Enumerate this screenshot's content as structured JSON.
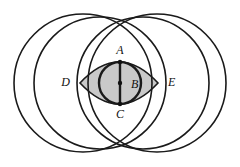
{
  "figure": {
    "canvas": {
      "width": 240,
      "height": 167,
      "background": "#ffffff"
    },
    "style": {
      "stroke_color": "#1a1a1a",
      "shaded_fill": "#c9c9c9",
      "point_color": "#111111",
      "label_color": "#111111",
      "thin_stroke_width": 1.6,
      "thick_stroke_width": 2.4,
      "point_radius": 2.2,
      "label_font_size": 12
    },
    "points": [
      {
        "id": "A",
        "label": "A",
        "x": 120,
        "y": 62,
        "label_x": 120,
        "label_y": 51,
        "anchor": "middle",
        "dot": true
      },
      {
        "id": "B",
        "label": "B",
        "x": 120,
        "y": 83,
        "label_x": 131,
        "label_y": 85,
        "anchor": "start",
        "dot": true
      },
      {
        "id": "C",
        "label": "C",
        "x": 120,
        "y": 104,
        "label_x": 120,
        "label_y": 115,
        "anchor": "middle",
        "dot": true
      },
      {
        "id": "D",
        "label": "D",
        "x": 80,
        "y": 83,
        "label_x": 70,
        "label_y": 83,
        "anchor": "end",
        "dot": false
      },
      {
        "id": "E",
        "label": "E",
        "x": 158,
        "y": 83,
        "label_x": 168,
        "label_y": 83,
        "anchor": "start",
        "dot": false
      }
    ],
    "circles": [
      {
        "id": "large-left",
        "name": "large-left-circle",
        "cx": 83,
        "cy": 83,
        "r": 69,
        "weight": "thin"
      },
      {
        "id": "large-right",
        "name": "large-right-circle",
        "cx": 157,
        "cy": 83,
        "r": 69,
        "weight": "thin"
      },
      {
        "id": "medium-left",
        "name": "medium-left-circle",
        "cx": 100,
        "cy": 83,
        "r": 66,
        "weight": "thin"
      },
      {
        "id": "medium-right",
        "name": "medium-right-circle",
        "cx": 143,
        "cy": 83,
        "r": 66,
        "weight": "thin"
      },
      {
        "id": "shaded",
        "name": "shaded-circle",
        "cx": 120,
        "cy": 83,
        "r": 21,
        "weight": "thick"
      }
    ],
    "lens": {
      "name": "lens-region",
      "left_x": 80,
      "right_x": 158,
      "center_y": 83,
      "bulge": 21,
      "description": "Eye-shaped lens spanning D to E formed by two symmetric arcs"
    },
    "segments": [
      {
        "id": "AC",
        "name": "vertical-diameter",
        "x1": 120,
        "y1": 62,
        "x2": 120,
        "y2": 104,
        "weight": "thick"
      }
    ],
    "intersections": [
      {
        "id": "top",
        "name": "top-intersection",
        "x": 122,
        "y": 19
      },
      {
        "id": "bottom",
        "name": "bottom-intersection",
        "x": 122,
        "y": 146
      }
    ]
  }
}
